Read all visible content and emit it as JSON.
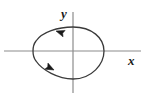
{
  "figure": {
    "kind": "parametric-closed-curve-plot",
    "background_color": "#ffffff",
    "axes": {
      "x_axis": {
        "label": "x",
        "color": "#8c8c8c",
        "stroke_width": 1.2,
        "y_position": 51,
        "x_start": 4,
        "x_end": 141
      },
      "y_axis": {
        "label": "y",
        "color": "#8c8c8c",
        "stroke_width": 1.2,
        "x_position": 73,
        "y_start": 12,
        "y_end": 93
      },
      "origin": {
        "x": 73,
        "y": 51
      }
    },
    "curve": {
      "name": "closed-loop-curve",
      "color": "#3a3a3a",
      "stroke_width": 1.3,
      "fill": "none",
      "orientation": "clockwise",
      "extents": {
        "leftmost_x": 33,
        "rightmost_x": 104,
        "topmost_y": 27,
        "bottommost_y": 79
      },
      "path": "M 73 27 C 92 27 104 38 104 51 C 104 64 92 79 73 79 C 58 79 42 70 36 61 C 32 56 32 46 36 41 C 42 32 58 27 73 27 Z"
    },
    "arrows": [
      {
        "name": "upper-direction-arrow",
        "position": {
          "x": 56,
          "y": 31
        },
        "angle_deg": 198,
        "color": "#1a1a1a",
        "meaning": "direction of travel along upper branch (leftward)"
      },
      {
        "name": "lower-direction-arrow",
        "position": {
          "x": 54,
          "y": 70
        },
        "angle_deg": 27,
        "color": "#1a1a1a",
        "meaning": "direction of travel along lower branch (rightward)"
      }
    ]
  },
  "chart_data": {
    "type": "line",
    "title": "",
    "xlabel": "x",
    "ylabel": "y",
    "grid": false,
    "legend": null,
    "annotations": [
      "arrowhead on upper-left of loop pointing left-downward",
      "arrowhead on lower-left of loop pointing right-downward"
    ],
    "series": [
      {
        "name": "closed-curve",
        "closed": true,
        "orientation": "clockwise",
        "x": [
          73,
          92,
          104,
          104,
          92,
          73,
          58,
          42,
          36,
          32,
          36,
          42,
          58,
          73
        ],
        "y": [
          27,
          27,
          38,
          51,
          64,
          79,
          79,
          70,
          61,
          51,
          41,
          32,
          27,
          27
        ]
      }
    ]
  }
}
